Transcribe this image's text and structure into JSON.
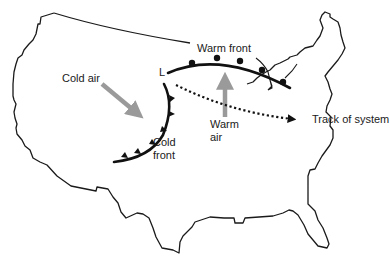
{
  "diagram": {
    "labels": {
      "low": "L",
      "warm_front": "Warm front",
      "cold_air": "Cold air",
      "warm_air_line1": "Warm",
      "warm_air_line2": "air",
      "cold_front_line1": "Cold",
      "cold_front_line2": "front",
      "track": "Track of system"
    },
    "colors": {
      "outline": "#1a1a1a",
      "front": "#111111",
      "air_arrow": "#9a9a9a",
      "background": "#ffffff"
    },
    "icons": {
      "low_pressure": "L-letter",
      "cold_front_symbol": "triangles",
      "warm_front_symbol": "semicircles",
      "track_arrow": "dotted-arrow"
    }
  }
}
